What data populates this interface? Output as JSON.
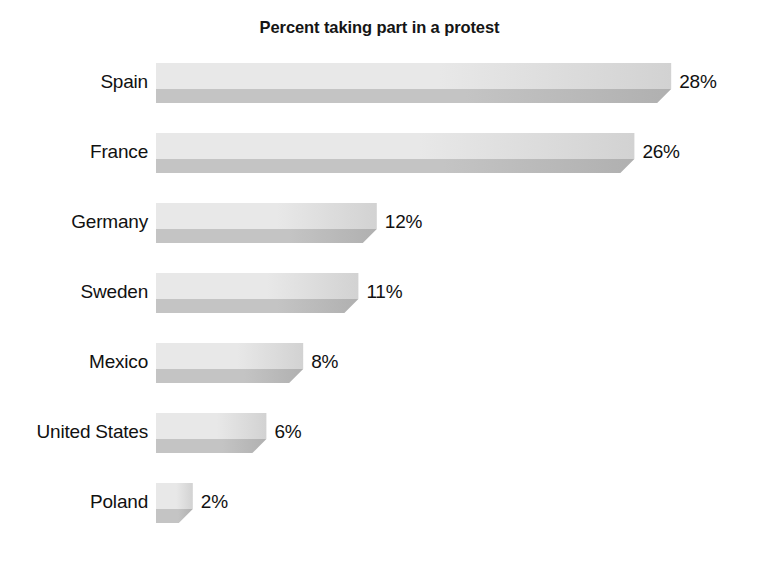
{
  "chart_data": {
    "type": "bar",
    "orientation": "horizontal",
    "style": "3d-horizontal-bar",
    "title": "Percent taking part in a protest",
    "subtitle": "",
    "xlabel": "",
    "ylabel": "",
    "grid": false,
    "legend": false,
    "axis_visible": false,
    "value_suffix": "%",
    "xlim": [
      0,
      28
    ],
    "categories": [
      "Spain",
      "France",
      "Germany",
      "Sweden",
      "Mexico",
      "United States",
      "Poland"
    ],
    "values": [
      28,
      26,
      12,
      11,
      8,
      6,
      2
    ],
    "value_labels": [
      "28%",
      "26%",
      "12%",
      "11%",
      "8%",
      "6%",
      "2%"
    ],
    "colors": {
      "bar_top_light": "#e8e8e8",
      "bar_top_dark": "#d2d2d2",
      "bar_front_light": "#c4c4c4",
      "bar_front_dark": "#b0b0b0",
      "bar_side": "#bdbdbd",
      "text": "#111111",
      "title": "#151515",
      "background": "#ffffff"
    }
  },
  "rows": [
    {
      "label": "Spain",
      "value": 28,
      "value_label": "28%"
    },
    {
      "label": "France",
      "value": 26,
      "value_label": "26%"
    },
    {
      "label": "Germany",
      "value": 12,
      "value_label": "12%"
    },
    {
      "label": "Sweden",
      "value": 11,
      "value_label": "11%"
    },
    {
      "label": "Mexico",
      "value": 8,
      "value_label": "8%"
    },
    {
      "label": "United States",
      "value": 6,
      "value_label": "6%"
    },
    {
      "label": "Poland",
      "value": 2,
      "value_label": "2%"
    }
  ]
}
